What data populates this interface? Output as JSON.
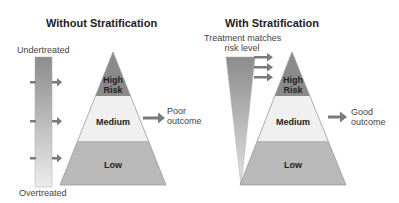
{
  "left_panel": {
    "title": "Without Stratification",
    "top_label": "Undertreated",
    "bottom_label": "Overtreated",
    "segments": [
      {
        "label": "High\nRisk",
        "line1": "High",
        "line2": "Risk"
      },
      {
        "label": "Medium"
      },
      {
        "label": "Low"
      }
    ],
    "outcome": {
      "line1": "Poor",
      "line2": "outcome"
    }
  },
  "right_panel": {
    "title": "With Stratification",
    "top_label": {
      "line1": "Treatment matches",
      "line2": "risk level"
    },
    "segments": [
      {
        "label": "High\nRisk",
        "line1": "High",
        "line2": "Risk"
      },
      {
        "label": "Medium"
      },
      {
        "label": "Low"
      }
    ],
    "outcome": {
      "line1": "Good",
      "line2": "outcome"
    }
  },
  "colors": {
    "high": "#8a8a8a",
    "medium": "#f0f0f0",
    "low": "#b9b9b9",
    "arrow": "#7a7a7a",
    "outline": "#9a9a9a"
  }
}
